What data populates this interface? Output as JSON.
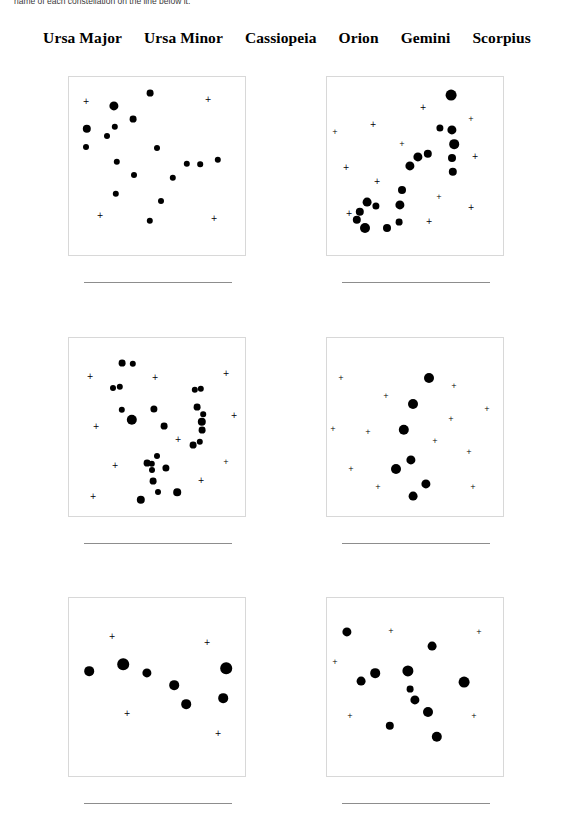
{
  "worksheet": {
    "instruction": "name of each constellation on the line below it.",
    "word_bank": {
      "label": "word-bank",
      "words": [
        "Ursa Major",
        "Ursa Minor",
        "Cassiopeia",
        "Orion",
        "Gemini",
        "Scorpius"
      ]
    },
    "answer_line_placeholder": ""
  },
  "colors": {
    "page_background": "#ffffff",
    "star_fill": "#000000",
    "box_border": "#d8d8d8",
    "answer_line": "#8d8d8d",
    "text": "#000000",
    "instruction_text": "#3a3a3a"
  },
  "constellations": [
    {
      "id": "panel-1",
      "position": "row-1-left",
      "answer": "",
      "stars": [
        {
          "x": 45,
          "y": 29,
          "r": 4.6
        },
        {
          "x": 81,
          "y": 16,
          "r": 3.4
        },
        {
          "x": 18,
          "y": 52,
          "r": 4.2
        },
        {
          "x": 64,
          "y": 42,
          "r": 3.4
        },
        {
          "x": 38,
          "y": 59,
          "r": 3.0
        },
        {
          "x": 46,
          "y": 50,
          "r": 3.2
        },
        {
          "x": 17,
          "y": 70,
          "r": 3.0
        },
        {
          "x": 88,
          "y": 71,
          "r": 3.0
        },
        {
          "x": 48,
          "y": 85,
          "r": 3.2
        },
        {
          "x": 118,
          "y": 87,
          "r": 3.2
        },
        {
          "x": 131,
          "y": 87,
          "r": 2.8
        },
        {
          "x": 149,
          "y": 83,
          "r": 3.2
        },
        {
          "x": 65,
          "y": 98,
          "r": 3.0
        },
        {
          "x": 104,
          "y": 101,
          "r": 3.2
        },
        {
          "x": 47,
          "y": 117,
          "r": 3.2
        },
        {
          "x": 92,
          "y": 124,
          "r": 3.0
        },
        {
          "x": 81,
          "y": 144,
          "r": 3.2
        }
      ],
      "crosses": [
        {
          "x": 17,
          "y": 25,
          "s": 8
        },
        {
          "x": 139,
          "y": 23,
          "s": 8
        },
        {
          "x": 31,
          "y": 139,
          "s": 8
        },
        {
          "x": 145,
          "y": 142,
          "s": 8
        }
      ]
    },
    {
      "id": "panel-2",
      "position": "row-1-right",
      "answer": "",
      "stars": [
        {
          "x": 124,
          "y": 18,
          "r": 5.4
        },
        {
          "x": 113,
          "y": 51,
          "r": 3.6
        },
        {
          "x": 125,
          "y": 53,
          "r": 4.6
        },
        {
          "x": 127,
          "y": 67,
          "r": 4.8
        },
        {
          "x": 125,
          "y": 81,
          "r": 4.0
        },
        {
          "x": 126,
          "y": 95,
          "r": 4.2
        },
        {
          "x": 101,
          "y": 77,
          "r": 4.2
        },
        {
          "x": 91,
          "y": 80,
          "r": 4.6
        },
        {
          "x": 83,
          "y": 89,
          "r": 4.6
        },
        {
          "x": 75,
          "y": 113,
          "r": 4.0
        },
        {
          "x": 73,
          "y": 128,
          "r": 4.6
        },
        {
          "x": 40,
          "y": 125,
          "r": 4.4
        },
        {
          "x": 49,
          "y": 129,
          "r": 3.6
        },
        {
          "x": 33,
          "y": 135,
          "r": 4.2
        },
        {
          "x": 30,
          "y": 143,
          "r": 4.2
        },
        {
          "x": 38,
          "y": 151,
          "r": 5.0
        },
        {
          "x": 60,
          "y": 151,
          "r": 4.0
        },
        {
          "x": 72,
          "y": 145,
          "r": 3.4
        }
      ],
      "crosses": [
        {
          "x": 96,
          "y": 31,
          "s": 8
        },
        {
          "x": 46,
          "y": 48,
          "s": 8
        },
        {
          "x": 8,
          "y": 55,
          "s": 7
        },
        {
          "x": 144,
          "y": 42,
          "s": 7
        },
        {
          "x": 75,
          "y": 67,
          "s": 7
        },
        {
          "x": 19,
          "y": 91,
          "s": 8
        },
        {
          "x": 148,
          "y": 80,
          "s": 8
        },
        {
          "x": 50,
          "y": 105,
          "s": 8
        },
        {
          "x": 112,
          "y": 120,
          "s": 7
        },
        {
          "x": 144,
          "y": 131,
          "s": 8
        },
        {
          "x": 22,
          "y": 137,
          "s": 8
        },
        {
          "x": 102,
          "y": 145,
          "s": 8
        }
      ]
    },
    {
      "id": "panel-3",
      "position": "row-2-left",
      "answer": "",
      "stars": [
        {
          "x": 53,
          "y": 25,
          "r": 3.4
        },
        {
          "x": 64,
          "y": 26,
          "r": 3.2
        },
        {
          "x": 44,
          "y": 50,
          "r": 3.0
        },
        {
          "x": 51,
          "y": 49,
          "r": 3.2
        },
        {
          "x": 53,
          "y": 72,
          "r": 3.2
        },
        {
          "x": 85,
          "y": 71,
          "r": 3.6
        },
        {
          "x": 63,
          "y": 82,
          "r": 5.2
        },
        {
          "x": 95,
          "y": 88,
          "r": 3.4
        },
        {
          "x": 126,
          "y": 52,
          "r": 3.2
        },
        {
          "x": 132,
          "y": 51,
          "r": 3.2
        },
        {
          "x": 128,
          "y": 69,
          "r": 3.4
        },
        {
          "x": 134,
          "y": 76,
          "r": 2.8
        },
        {
          "x": 133,
          "y": 84,
          "r": 4.2
        },
        {
          "x": 133,
          "y": 92,
          "r": 3.4
        },
        {
          "x": 124,
          "y": 107,
          "r": 3.4
        },
        {
          "x": 131,
          "y": 104,
          "r": 3.2
        },
        {
          "x": 88,
          "y": 118,
          "r": 3.0
        },
        {
          "x": 83,
          "y": 126,
          "r": 3.2
        },
        {
          "x": 78,
          "y": 125,
          "r": 3.4
        },
        {
          "x": 83,
          "y": 132,
          "r": 3.0
        },
        {
          "x": 97,
          "y": 130,
          "r": 3.6
        },
        {
          "x": 84,
          "y": 143,
          "r": 3.4
        },
        {
          "x": 89,
          "y": 154,
          "r": 3.0
        },
        {
          "x": 108,
          "y": 154,
          "r": 3.8
        },
        {
          "x": 72,
          "y": 162,
          "r": 4.2
        }
      ],
      "crosses": [
        {
          "x": 21,
          "y": 39,
          "s": 8
        },
        {
          "x": 86,
          "y": 40,
          "s": 8
        },
        {
          "x": 157,
          "y": 36,
          "s": 8
        },
        {
          "x": 27,
          "y": 89,
          "s": 8
        },
        {
          "x": 165,
          "y": 78,
          "s": 8
        },
        {
          "x": 109,
          "y": 102,
          "s": 8
        },
        {
          "x": 46,
          "y": 128,
          "s": 8
        },
        {
          "x": 157,
          "y": 124,
          "s": 7
        },
        {
          "x": 132,
          "y": 143,
          "s": 8
        },
        {
          "x": 24,
          "y": 159,
          "s": 8
        }
      ]
    },
    {
      "id": "panel-4",
      "position": "row-2-right",
      "answer": "",
      "stars": [
        {
          "x": 102,
          "y": 40,
          "r": 5.0
        },
        {
          "x": 86,
          "y": 66,
          "r": 5.0
        },
        {
          "x": 77,
          "y": 92,
          "r": 5.2
        },
        {
          "x": 84,
          "y": 122,
          "r": 4.6
        },
        {
          "x": 69,
          "y": 131,
          "r": 5.0
        },
        {
          "x": 99,
          "y": 146,
          "r": 4.6
        },
        {
          "x": 86,
          "y": 158,
          "r": 4.4
        }
      ],
      "crosses": [
        {
          "x": 14,
          "y": 40,
          "s": 7
        },
        {
          "x": 59,
          "y": 58,
          "s": 7
        },
        {
          "x": 127,
          "y": 48,
          "s": 7
        },
        {
          "x": 160,
          "y": 71,
          "s": 7
        },
        {
          "x": 124,
          "y": 81,
          "s": 7
        },
        {
          "x": 6,
          "y": 91,
          "s": 7
        },
        {
          "x": 41,
          "y": 94,
          "s": 7
        },
        {
          "x": 108,
          "y": 103,
          "s": 7
        },
        {
          "x": 142,
          "y": 114,
          "s": 7
        },
        {
          "x": 24,
          "y": 131,
          "s": 7
        },
        {
          "x": 51,
          "y": 149,
          "s": 7
        },
        {
          "x": 146,
          "y": 149,
          "s": 7
        }
      ]
    },
    {
      "id": "panel-5",
      "position": "row-3-left",
      "answer": "",
      "stars": [
        {
          "x": 20,
          "y": 73,
          "r": 4.8
        },
        {
          "x": 54,
          "y": 66,
          "r": 5.8
        },
        {
          "x": 78,
          "y": 75,
          "r": 4.6
        },
        {
          "x": 105,
          "y": 87,
          "r": 4.8
        },
        {
          "x": 117,
          "y": 106,
          "r": 4.8
        },
        {
          "x": 157,
          "y": 70,
          "r": 5.8
        },
        {
          "x": 154,
          "y": 100,
          "r": 4.8
        }
      ],
      "crosses": [
        {
          "x": 43,
          "y": 39,
          "s": 8
        },
        {
          "x": 138,
          "y": 45,
          "s": 8
        },
        {
          "x": 58,
          "y": 116,
          "s": 8
        },
        {
          "x": 149,
          "y": 136,
          "s": 8
        }
      ]
    },
    {
      "id": "panel-6",
      "position": "row-3-right",
      "answer": "",
      "stars": [
        {
          "x": 20,
          "y": 34,
          "r": 4.6
        },
        {
          "x": 105,
          "y": 48,
          "r": 4.4
        },
        {
          "x": 48,
          "y": 75,
          "r": 4.8
        },
        {
          "x": 34,
          "y": 83,
          "r": 4.4
        },
        {
          "x": 81,
          "y": 73,
          "r": 5.6
        },
        {
          "x": 83,
          "y": 91,
          "r": 3.4
        },
        {
          "x": 88,
          "y": 102,
          "r": 4.6
        },
        {
          "x": 101,
          "y": 114,
          "r": 5.0
        },
        {
          "x": 137,
          "y": 84,
          "r": 5.4
        },
        {
          "x": 63,
          "y": 128,
          "r": 4.2
        },
        {
          "x": 110,
          "y": 139,
          "r": 5.2
        }
      ],
      "crosses": [
        {
          "x": 64,
          "y": 33,
          "s": 7
        },
        {
          "x": 152,
          "y": 34,
          "s": 7
        },
        {
          "x": 8,
          "y": 64,
          "s": 7
        },
        {
          "x": 23,
          "y": 118,
          "s": 7
        },
        {
          "x": 147,
          "y": 118,
          "s": 7
        }
      ]
    }
  ]
}
